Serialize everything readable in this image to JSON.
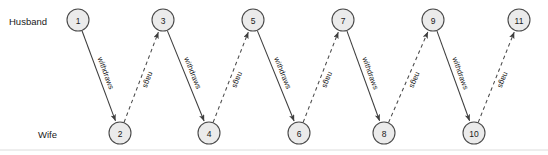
{
  "figure": {
    "type": "sequence-interaction-diagram",
    "background_color": "#ffffff"
  },
  "lanes": [
    {
      "id": "husband",
      "label": "Husband",
      "label_x": 9,
      "label_y": 21,
      "row_y": 20
    },
    {
      "id": "wife",
      "label": "Wife",
      "label_x": 38,
      "label_y": 134,
      "row_y": 133
    }
  ],
  "node_style": {
    "radius": 11,
    "fill": "#ebebeb",
    "stroke": "#4a4a4a"
  },
  "nodes": [
    {
      "id": "n1",
      "label": "1",
      "lane": "husband",
      "cx": 78,
      "cy": 20
    },
    {
      "id": "n2",
      "label": "2",
      "lane": "wife",
      "cx": 120,
      "cy": 133
    },
    {
      "id": "n3",
      "label": "3",
      "lane": "husband",
      "cx": 163,
      "cy": 20
    },
    {
      "id": "n4",
      "label": "4",
      "lane": "wife",
      "cx": 209,
      "cy": 133
    },
    {
      "id": "n5",
      "label": "5",
      "lane": "husband",
      "cx": 253,
      "cy": 20
    },
    {
      "id": "n6",
      "label": "6",
      "lane": "wife",
      "cx": 299,
      "cy": 133
    },
    {
      "id": "n7",
      "label": "7",
      "lane": "husband",
      "cx": 343,
      "cy": 20
    },
    {
      "id": "n8",
      "label": "8",
      "lane": "wife",
      "cx": 384,
      "cy": 133
    },
    {
      "id": "n9",
      "label": "9",
      "lane": "husband",
      "cx": 433,
      "cy": 20
    },
    {
      "id": "n10",
      "label": "10",
      "lane": "wife",
      "cx": 474,
      "cy": 133
    },
    {
      "id": "n11",
      "label": "11",
      "lane": "husband",
      "cx": 519,
      "cy": 20
    }
  ],
  "edges": [
    {
      "id": "e1",
      "from": "n1",
      "to": "n2",
      "label": "withdraws",
      "style": "solid",
      "direction": "down"
    },
    {
      "id": "e2",
      "from": "n2",
      "to": "n3",
      "label": "nags",
      "style": "dashed",
      "direction": "up"
    },
    {
      "id": "e3",
      "from": "n3",
      "to": "n4",
      "label": "withdraws",
      "style": "solid",
      "direction": "down"
    },
    {
      "id": "e4",
      "from": "n4",
      "to": "n5",
      "label": "nags",
      "style": "dashed",
      "direction": "up"
    },
    {
      "id": "e5",
      "from": "n5",
      "to": "n6",
      "label": "withdraws",
      "style": "solid",
      "direction": "down"
    },
    {
      "id": "e6",
      "from": "n6",
      "to": "n7",
      "label": "nags",
      "style": "dashed",
      "direction": "up"
    },
    {
      "id": "e7",
      "from": "n7",
      "to": "n8",
      "label": "withdraws",
      "style": "solid",
      "direction": "down"
    },
    {
      "id": "e8",
      "from": "n8",
      "to": "n9",
      "label": "nags",
      "style": "dashed",
      "direction": "up"
    },
    {
      "id": "e9",
      "from": "n9",
      "to": "n10",
      "label": "withdraws",
      "style": "solid",
      "direction": "down"
    },
    {
      "id": "e10",
      "from": "n10",
      "to": "n11",
      "label": "nags",
      "style": "dashed",
      "direction": "up"
    }
  ],
  "baseline": {
    "y": 150,
    "color": "#dcdcdc"
  }
}
